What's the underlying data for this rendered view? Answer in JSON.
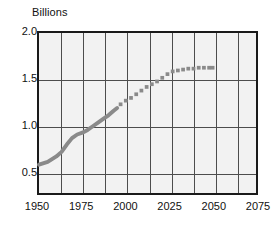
{
  "chart_data": {
    "type": "line",
    "title": "",
    "ylabel": "Billions",
    "xlabel": "",
    "xlim": [
      1950,
      2075
    ],
    "ylim": [
      0.25,
      2.0
    ],
    "grid": true,
    "legend": "none",
    "y_ticks": [
      "2.0",
      "1.5",
      "1.0",
      "0.5"
    ],
    "y_tick_values": [
      2.0,
      1.5,
      1.0,
      0.5
    ],
    "x_ticks": [
      "1950",
      "1975",
      "2000",
      "2025",
      "2050",
      "2075"
    ],
    "x_tick_values": [
      1950,
      1975,
      2000,
      2025,
      2050,
      2075
    ],
    "x_gridlines": [
      1962.5,
      1975,
      1987.5,
      2000,
      2012.5,
      2025,
      2037.5,
      2050,
      2062.5
    ],
    "y_gridlines": [
      0.5,
      1.0,
      1.5
    ],
    "series": [
      {
        "name": "Historical",
        "style": "solid",
        "color": "#8a8a8a",
        "x": [
          1950,
          1955,
          1960,
          1963,
          1966,
          1969,
          1972,
          1975,
          1978,
          1981,
          1984,
          1987,
          1990,
          1993,
          1995
        ],
        "values": [
          0.56,
          0.59,
          0.65,
          0.7,
          0.78,
          0.85,
          0.89,
          0.91,
          0.94,
          0.98,
          1.02,
          1.06,
          1.1,
          1.15,
          1.18
        ]
      },
      {
        "name": "Projected",
        "style": "dotted",
        "color": "#8a8a8a",
        "x": [
          1997,
          2000,
          2003,
          2006,
          2009,
          2012,
          2015,
          2018,
          2021,
          2024,
          2027,
          2030,
          2033,
          2036,
          2039,
          2042,
          2045,
          2048,
          2050
        ],
        "values": [
          1.22,
          1.26,
          1.29,
          1.33,
          1.37,
          1.41,
          1.44,
          1.47,
          1.51,
          1.55,
          1.58,
          1.59,
          1.6,
          1.61,
          1.61,
          1.62,
          1.62,
          1.62,
          1.62
        ]
      }
    ]
  },
  "colors": {
    "plot_background": "#f2f2f2",
    "plot_border": "#1a1a1a",
    "gridline": "#4d4d4d",
    "series": "#8a8a8a",
    "text": "#111111"
  }
}
